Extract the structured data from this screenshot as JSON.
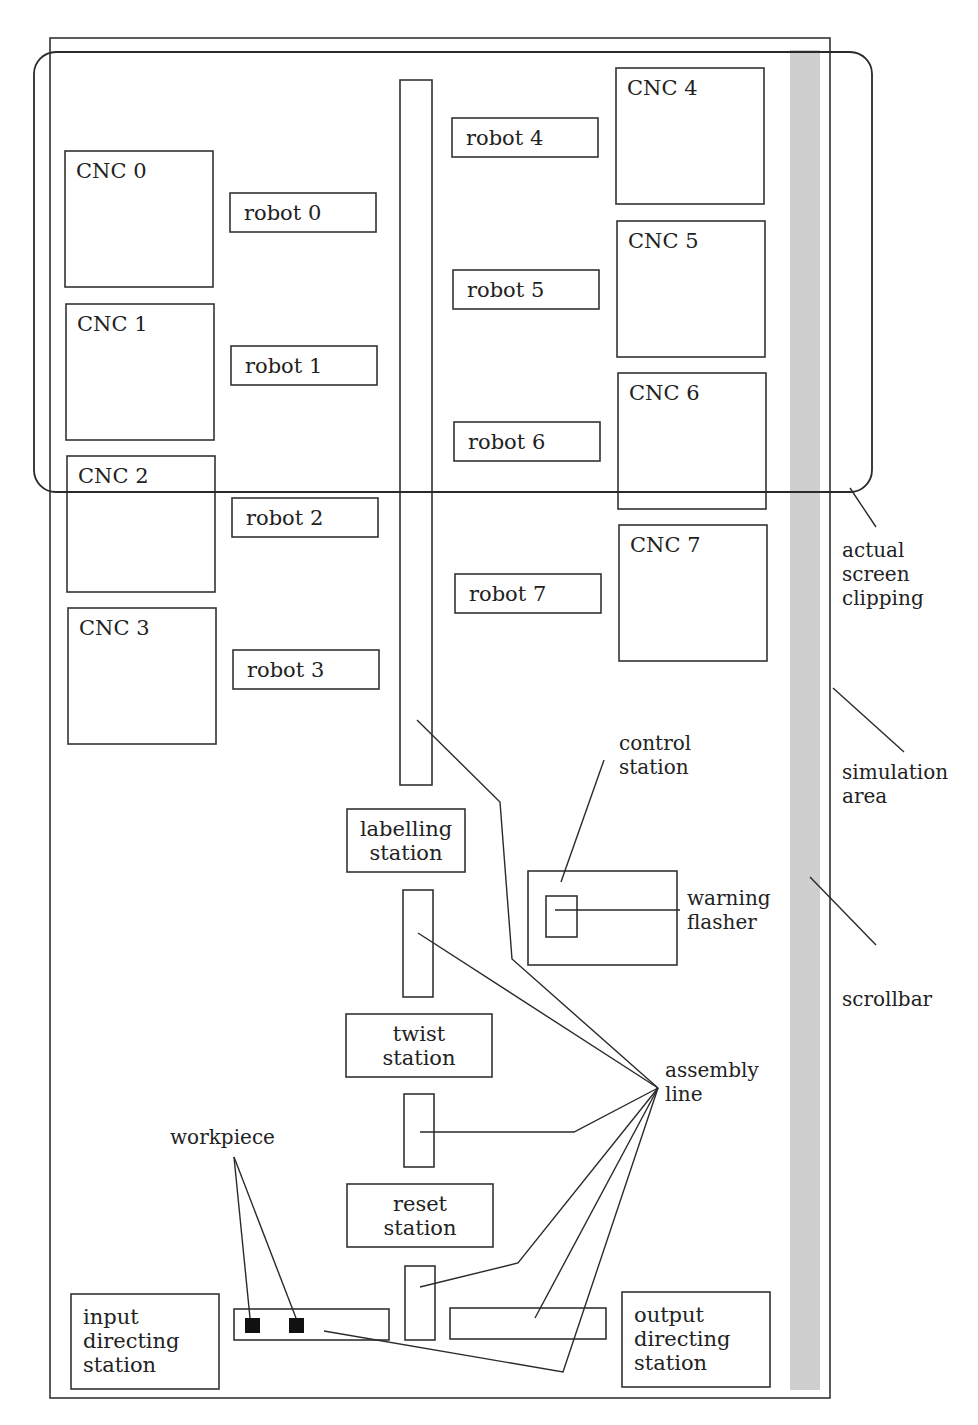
{
  "colors": {
    "stroke": "#333333",
    "scrollbar": "#cfcfcf",
    "workpiece": "#111111",
    "background": "#ffffff"
  },
  "simulation_area": {
    "x": 50,
    "y": 38,
    "w": 780,
    "h": 1360
  },
  "screen_clipping": {
    "x": 34,
    "y": 52,
    "w": 838,
    "h": 440,
    "r": 22
  },
  "scrollbar": {
    "x": 790,
    "y": 50,
    "w": 30,
    "h": 1340
  },
  "main_conveyor": {
    "x": 400,
    "y": 80,
    "w": 32,
    "h": 705
  },
  "cncs": [
    {
      "label": "CNC 0",
      "x": 65,
      "y": 151,
      "w": 148,
      "h": 136
    },
    {
      "label": "CNC 1",
      "x": 66,
      "y": 304,
      "w": 148,
      "h": 136
    },
    {
      "label": "CNC 2",
      "x": 67,
      "y": 456,
      "w": 148,
      "h": 136
    },
    {
      "label": "CNC 3",
      "x": 68,
      "y": 608,
      "w": 148,
      "h": 136
    },
    {
      "label": "CNC 4",
      "x": 616,
      "y": 68,
      "w": 148,
      "h": 136
    },
    {
      "label": "CNC 5",
      "x": 617,
      "y": 221,
      "w": 148,
      "h": 136
    },
    {
      "label": "CNC 6",
      "x": 618,
      "y": 373,
      "w": 148,
      "h": 136
    },
    {
      "label": "CNC 7",
      "x": 619,
      "y": 525,
      "w": 148,
      "h": 136
    }
  ],
  "robots": [
    {
      "label": "robot 0",
      "x": 230,
      "y": 193,
      "w": 146,
      "h": 39
    },
    {
      "label": "robot 1",
      "x": 231,
      "y": 346,
      "w": 146,
      "h": 39
    },
    {
      "label": "robot 2",
      "x": 232,
      "y": 498,
      "w": 146,
      "h": 39
    },
    {
      "label": "robot 3",
      "x": 233,
      "y": 650,
      "w": 146,
      "h": 39
    },
    {
      "label": "robot 4",
      "x": 452,
      "y": 118,
      "w": 146,
      "h": 39
    },
    {
      "label": "robot 5",
      "x": 453,
      "y": 270,
      "w": 146,
      "h": 39
    },
    {
      "label": "robot 6",
      "x": 454,
      "y": 422,
      "w": 146,
      "h": 39
    },
    {
      "label": "robot 7",
      "x": 455,
      "y": 574,
      "w": 146,
      "h": 39
    }
  ],
  "stations": [
    {
      "id": "labelling",
      "lines": [
        "labelling",
        "station"
      ],
      "x": 347,
      "y": 809,
      "w": 118,
      "h": 63
    },
    {
      "id": "twist",
      "lines": [
        "twist",
        "station"
      ],
      "x": 346,
      "y": 1014,
      "w": 146,
      "h": 63
    },
    {
      "id": "reset",
      "lines": [
        "reset",
        "station"
      ],
      "x": 347,
      "y": 1184,
      "w": 146,
      "h": 63
    },
    {
      "id": "input-directing",
      "lines": [
        "input",
        "directing",
        "station"
      ],
      "x": 71,
      "y": 1294,
      "w": 148,
      "h": 95,
      "align": "left"
    },
    {
      "id": "output-directing",
      "lines": [
        "output",
        "directing",
        "station"
      ],
      "x": 622,
      "y": 1292,
      "w": 148,
      "h": 95,
      "align": "left"
    }
  ],
  "conveyor_segments": [
    {
      "x": 403,
      "y": 890,
      "w": 30,
      "h": 107
    },
    {
      "x": 404,
      "y": 1094,
      "w": 30,
      "h": 73
    },
    {
      "x": 405,
      "y": 1266,
      "w": 30,
      "h": 74
    },
    {
      "x": 234,
      "y": 1309,
      "w": 155,
      "h": 31
    },
    {
      "x": 450,
      "y": 1308,
      "w": 156,
      "h": 31
    }
  ],
  "workpieces": [
    {
      "x": 245,
      "y": 1318,
      "size": 15
    },
    {
      "x": 289,
      "y": 1318,
      "size": 15
    }
  ],
  "control_station": {
    "x": 528,
    "y": 871,
    "w": 149,
    "h": 94
  },
  "warning_flasher": {
    "x": 546,
    "y": 896,
    "w": 31,
    "h": 41
  },
  "annotations": {
    "actual_screen_clipping": {
      "lines": [
        "actual",
        "screen",
        "clipping"
      ],
      "x": 842,
      "y": 557
    },
    "simulation_area": {
      "lines": [
        "simulation",
        "area"
      ],
      "x": 842,
      "y": 779
    },
    "scrollbar": {
      "lines": [
        "scrollbar"
      ],
      "x": 842,
      "y": 1006
    },
    "control_station": {
      "lines": [
        "control",
        "station"
      ],
      "x": 619,
      "y": 750
    },
    "warning_flasher": {
      "lines": [
        "warning",
        "flasher"
      ],
      "x": 687,
      "y": 905
    },
    "assembly_line": {
      "lines": [
        "assembly",
        "line"
      ],
      "x": 665,
      "y": 1077
    },
    "workpiece": {
      "lines": [
        "workpiece"
      ],
      "x": 170,
      "y": 1144
    }
  },
  "leaders": [
    {
      "name": "clipping-leader",
      "points": [
        [
          850,
          488
        ],
        [
          876,
          527
        ]
      ]
    },
    {
      "name": "simulation-area-leader",
      "points": [
        [
          833,
          688
        ],
        [
          904,
          752
        ]
      ]
    },
    {
      "name": "scrollbar-leader",
      "points": [
        [
          810,
          877
        ],
        [
          876,
          945
        ]
      ]
    },
    {
      "name": "control-station-leader",
      "points": [
        [
          561,
          882
        ],
        [
          604,
          760
        ]
      ]
    },
    {
      "name": "warning-flasher-leader",
      "points": [
        [
          555,
          910
        ],
        [
          680,
          910
        ]
      ]
    },
    {
      "name": "assembly-leader-main",
      "points": [
        [
          417,
          720
        ],
        [
          500,
          802
        ],
        [
          512,
          959
        ],
        [
          658,
          1088
        ]
      ]
    },
    {
      "name": "assembly-leader-seg1",
      "points": [
        [
          418,
          933
        ],
        [
          658,
          1088
        ]
      ]
    },
    {
      "name": "assembly-leader-seg2",
      "points": [
        [
          420,
          1132
        ],
        [
          574,
          1132
        ],
        [
          658,
          1088
        ]
      ]
    },
    {
      "name": "assembly-leader-seg3",
      "points": [
        [
          420,
          1287
        ],
        [
          518,
          1263
        ],
        [
          658,
          1088
        ]
      ]
    },
    {
      "name": "assembly-leader-seg4",
      "points": [
        [
          535,
          1318
        ],
        [
          658,
          1088
        ]
      ]
    },
    {
      "name": "assembly-leader-seg5",
      "points": [
        [
          324,
          1331
        ],
        [
          563,
          1372
        ],
        [
          658,
          1088
        ]
      ]
    },
    {
      "name": "workpiece-leader-1",
      "points": [
        [
          234,
          1157
        ],
        [
          250,
          1318
        ]
      ]
    },
    {
      "name": "workpiece-leader-2",
      "points": [
        [
          234,
          1157
        ],
        [
          296,
          1318
        ]
      ]
    }
  ]
}
